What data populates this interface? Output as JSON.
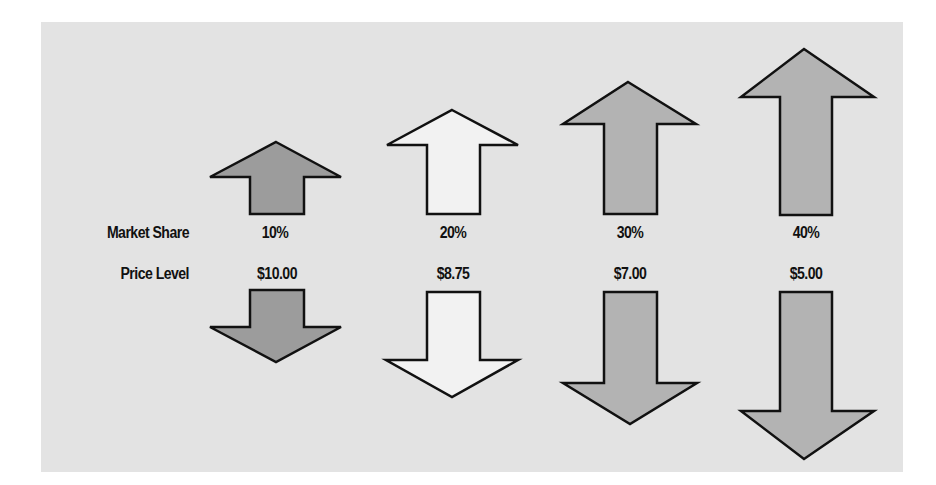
{
  "row_labels": {
    "market_share": "Market Share",
    "price_level": "Price Level"
  },
  "colors": {
    "panel_bg": "#e3e3e3",
    "dark_fill": "#9c9c9c",
    "light_fill": "#f2f2f2",
    "mid_fill": "#b3b3b3",
    "outline": "#111111"
  },
  "columns": [
    {
      "market_share": "10%",
      "price_level": "$10.00",
      "fill": "dark"
    },
    {
      "market_share": "20%",
      "price_level": "$8.75",
      "fill": "light"
    },
    {
      "market_share": "30%",
      "price_level": "$7.00",
      "fill": "mid"
    },
    {
      "market_share": "40%",
      "price_level": "$5.00",
      "fill": "mid"
    }
  ]
}
